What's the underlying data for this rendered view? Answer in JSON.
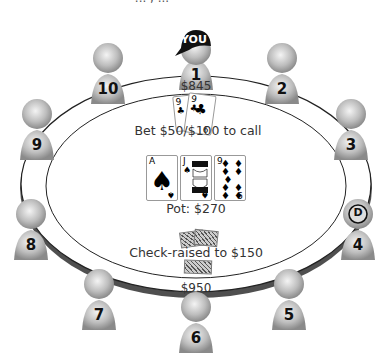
{
  "header": {
    "partial_caption": "... , ..."
  },
  "table": {
    "rail_color": "#555555",
    "felt_color": "#ffffff",
    "pot_label": "Pot: $270",
    "community_cards": [
      {
        "rank": "A",
        "suit": "♠",
        "color": "#000000"
      },
      {
        "rank": "J",
        "suit": "♠",
        "color": "#000000"
      },
      {
        "rank": "9",
        "suit": "♦",
        "color": "#000000"
      }
    ]
  },
  "seats": [
    {
      "number": "1",
      "label": "YOU",
      "is_hero": true
    },
    {
      "number": "2"
    },
    {
      "number": "3"
    },
    {
      "number": "4",
      "dealer_button": "D"
    },
    {
      "number": "5"
    },
    {
      "number": "6"
    },
    {
      "number": "7"
    },
    {
      "number": "8"
    },
    {
      "number": "9"
    },
    {
      "number": "10"
    }
  ],
  "hero": {
    "seat": "1",
    "stack": "$845",
    "hole_cards": [
      {
        "rank": "9",
        "suit": "♣"
      },
      {
        "rank": "9",
        "suit": "♣"
      }
    ],
    "action": "Bet $50/$100 to call"
  },
  "villain": {
    "seat": "6",
    "stack": "$950",
    "hole_cards": "face-down",
    "action": "Check-raised to $150"
  }
}
